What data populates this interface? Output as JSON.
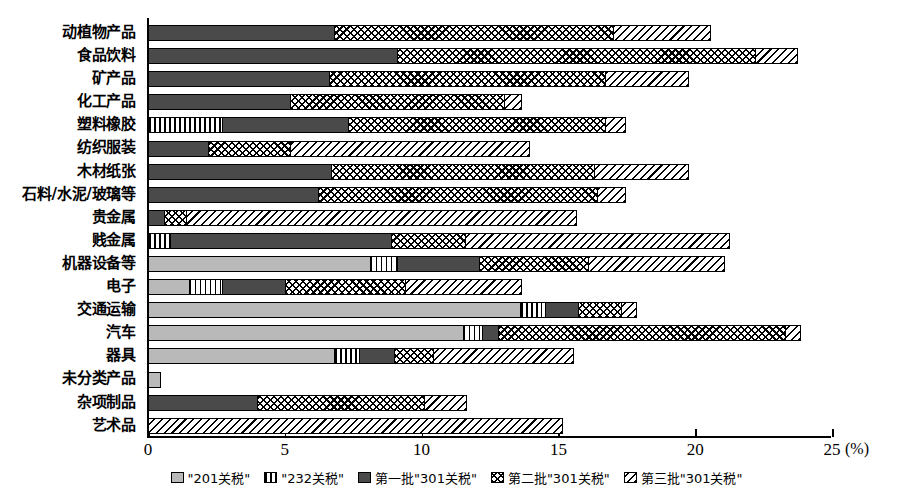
{
  "chart_data": {
    "type": "bar",
    "orientation": "horizontal",
    "stacked": true,
    "title": "",
    "xlabel": "(%)",
    "ylabel": "",
    "xlim": [
      0,
      25
    ],
    "xticks": [
      0,
      5,
      10,
      15,
      20,
      25
    ],
    "xtick_labels": [
      "0",
      "5",
      "10",
      "15",
      "20",
      "25"
    ],
    "unit": "(%)",
    "grid": false,
    "legend_position": "bottom",
    "categories": [
      "动植物产品",
      "食品饮料",
      "矿产品",
      "化工产品",
      "塑料橡胶",
      "纺织服装",
      "木材纸张",
      "石料/水泥/玻璃等",
      "贵金属",
      "贱金属",
      "机器设备等",
      "电子",
      "交通运输",
      "汽车",
      "器具",
      "未分类产品",
      "杂项制品",
      "艺术品"
    ],
    "series": [
      {
        "name": "\"201关税\"",
        "pattern": "light-gray-solid",
        "color": "#b9b9b9",
        "values": [
          0,
          0,
          0,
          0,
          0,
          0,
          0,
          0,
          0,
          0,
          8.1,
          1.5,
          13.6,
          11.5,
          6.8,
          0.4,
          0,
          0
        ]
      },
      {
        "name": "\"232关税\"",
        "pattern": "vertical-stripes",
        "color": "#ffffff",
        "values": [
          0,
          0,
          0,
          0,
          2.7,
          0,
          0,
          0,
          0,
          0.8,
          1.0,
          1.2,
          0.9,
          0.7,
          0.9,
          0,
          0,
          0
        ]
      },
      {
        "name": "第一批\"301关税\"",
        "pattern": "dark-gray-solid",
        "color": "#4a4a4a",
        "values": [
          6.8,
          9.1,
          6.6,
          5.2,
          4.6,
          2.2,
          6.7,
          6.2,
          0.6,
          8.1,
          3.0,
          2.3,
          1.2,
          0.6,
          1.3,
          0,
          4.0,
          0
        ]
      },
      {
        "name": "第二批\"301关税\"",
        "pattern": "crosshatch",
        "color": "#ffffff",
        "values": [
          10.2,
          13.1,
          10.1,
          7.8,
          9.4,
          3.0,
          9.6,
          10.2,
          0.8,
          2.7,
          4.0,
          4.4,
          1.6,
          10.5,
          1.4,
          0,
          6.1,
          0
        ]
      },
      {
        "name": "第三批\"301关税\"",
        "pattern": "diagonal-hatch",
        "color": "#ffffff",
        "values": [
          3.5,
          1.5,
          3.0,
          0.6,
          0.7,
          8.7,
          3.4,
          1.0,
          14.2,
          9.6,
          4.9,
          4.2,
          0.5,
          0.5,
          5.1,
          0,
          1.5,
          15.1
        ]
      }
    ],
    "totals": [
      20.5,
      23.7,
      19.7,
      13.6,
      17.4,
      13.9,
      19.7,
      17.4,
      15.6,
      21.2,
      21.0,
      13.6,
      17.8,
      23.8,
      15.5,
      0.4,
      11.6,
      15.1
    ],
    "legend_entries": [
      {
        "label": "\"201关税\"",
        "pattern": "light-gray-solid"
      },
      {
        "label": "\"232关税\"",
        "pattern": "vertical-stripes"
      },
      {
        "label": "第一批\"301关税\"",
        "pattern": "dark-gray-solid"
      },
      {
        "label": "第二批\"301关税\"",
        "pattern": "crosshatch"
      },
      {
        "label": "第三批\"301关税\"",
        "pattern": "diagonal-hatch"
      }
    ]
  }
}
